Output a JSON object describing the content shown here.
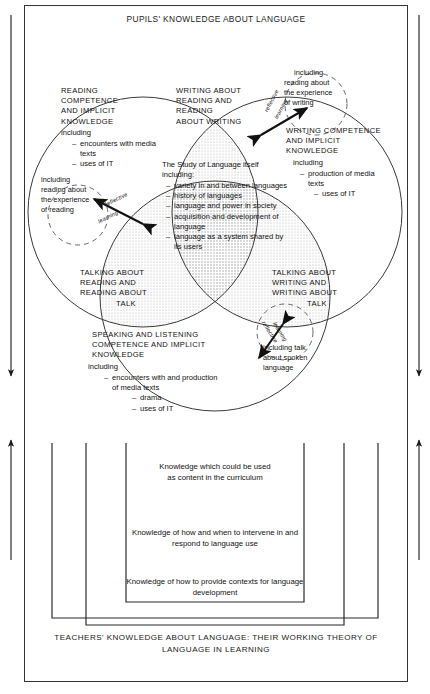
{
  "diagram": {
    "title": "PUPILS' KNOWLEDGE ABOUT LANGUAGE",
    "footer": "TEACHERS' KNOWLEDGE ABOUT LANGUAGE: THEIR WORKING THEORY OF LANGUAGE IN LEARNING"
  },
  "circles": {
    "reading": {
      "heading": "READING COMPETENCE AND IMPLICIT KNOWLEDGE",
      "heading_lines": [
        "READING",
        "COMPETENCE",
        "AND IMPLICIT",
        "KNOWLEDGE"
      ],
      "including_label": "including",
      "items": [
        "encounters with media texts",
        "uses of IT"
      ]
    },
    "writing": {
      "heading": "WRITING COMPETENCE AND IMPLICIT KNOWLEDGE",
      "heading_lines": [
        "WRITING COMPETENCE",
        "AND IMPLICIT",
        "KNOWLEDGE"
      ],
      "including_label": "including",
      "items": [
        "production of media texts",
        "uses of IT"
      ]
    },
    "speaking": {
      "heading": "SPEAKING AND LISTENING COMPETENCE AND IMPLICIT KNOWLEDGE",
      "heading_lines": [
        "SPEAKING AND LISTENING",
        "COMPETENCE AND IMPLICIT",
        "KNOWLEDGE"
      ],
      "including_label": "including",
      "items": [
        "encounters with and production of media texts",
        "drama",
        "uses of IT"
      ]
    }
  },
  "intersections": {
    "write_read": {
      "lines": [
        "WRITING ABOUT",
        "READING AND",
        "READING",
        "ABOUT WRITING"
      ]
    },
    "talk_read": {
      "lines": [
        "TALKING ABOUT",
        "READING AND",
        "READING ABOUT",
        "TALK"
      ]
    },
    "talk_write": {
      "lines": [
        "TALKING ABOUT",
        "WRITING AND",
        "WRITING ABOUT",
        "TALK"
      ]
    }
  },
  "core": {
    "heading": "The Study of Language itself",
    "including_label": "including:",
    "items": [
      "variety in and between languages",
      "history of languages",
      "language and power in society",
      "acquisition and development of language",
      "language as a system shared by its users"
    ]
  },
  "bubbles": [
    {
      "name": "reading-experience-bubble",
      "lines": [
        "including",
        "reading about",
        "the experience",
        "of reading"
      ]
    },
    {
      "name": "writing-experience-bubble",
      "lines": [
        "including",
        "reading about",
        "the experience",
        "of writing"
      ]
    },
    {
      "name": "spoken-language-bubble",
      "lines": [
        "including talk",
        "about spoken",
        "language"
      ]
    }
  ],
  "reflective_arrows": [
    {
      "name": "reflective-learning-left",
      "top": "reflective",
      "bottom": "learning"
    },
    {
      "name": "reflective-learning-right",
      "top": "reflective",
      "bottom": "learning"
    },
    {
      "name": "reflective-learning-bottom",
      "top": "reflective",
      "bottom": "learning"
    }
  ],
  "teacher_boxes": [
    {
      "name": "content-curriculum-box",
      "lines": [
        "Knowledge which could be used",
        "as content in the curriculum"
      ]
    },
    {
      "name": "intervene-respond-box",
      "lines": [
        "Knowledge of how and when to intervene in and",
        "respond to language use"
      ]
    },
    {
      "name": "contexts-development-box",
      "lines": [
        "Knowledge of how to provide contexts for language",
        "development"
      ]
    }
  ],
  "colors": {
    "stroke": "#333333",
    "overlap_fill": "#dddddd",
    "core_fill": "#e8e8e8",
    "text": "#111111",
    "page": "#ffffff"
  }
}
